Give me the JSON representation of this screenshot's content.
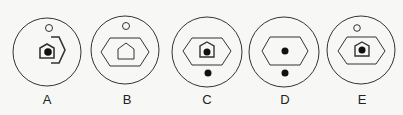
{
  "figure": {
    "stroke_color": "#333333",
    "background": "#f7f7f5",
    "options": [
      {
        "label": "A",
        "cx": 47,
        "cy": 52,
        "r": 34,
        "elements": [
          "small-open-circle-top",
          "small-pentagon-with-dot",
          "partial-hexagon-right-bracket"
        ]
      },
      {
        "label": "B",
        "cx": 125,
        "cy": 50,
        "r": 34,
        "elements": [
          "small-open-circle-top",
          "hexagon",
          "pentagon-empty"
        ]
      },
      {
        "label": "C",
        "cx": 207,
        "cy": 52,
        "r": 35,
        "elements": [
          "hexagon",
          "pentagon-with-dot",
          "filled-dot-below"
        ]
      },
      {
        "label": "D",
        "cx": 284,
        "cy": 52,
        "r": 35,
        "elements": [
          "hexagon",
          "filled-dot-center",
          "filled-dot-below"
        ]
      },
      {
        "label": "E",
        "cx": 361,
        "cy": 50,
        "r": 34,
        "elements": [
          "small-open-circle-top",
          "hexagon",
          "pentagon-with-dot"
        ]
      }
    ]
  },
  "labels": {
    "a": "A",
    "b": "B",
    "c": "C",
    "d": "D",
    "e": "E"
  }
}
